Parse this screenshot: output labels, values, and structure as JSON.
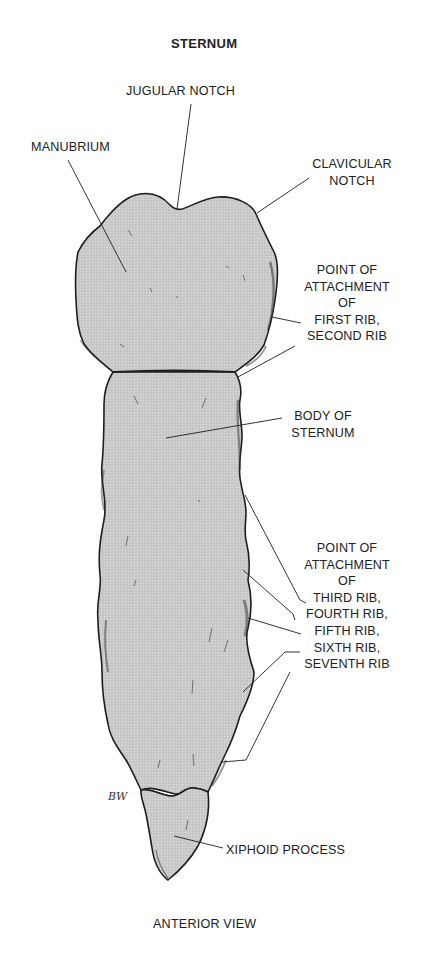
{
  "figure": {
    "title": "STERNUM",
    "caption": "ANTERIOR VIEW",
    "signature": "BW",
    "colors": {
      "background": "#ffffff",
      "bone_fill": "#cbcbcb",
      "outline": "#1e1e1e",
      "text": "#222222"
    }
  },
  "labels": {
    "jugular_notch": "JUGULAR NOTCH",
    "manubrium": "MANUBRIUM",
    "clavicular_notch": [
      "CLAVICULAR",
      "NOTCH"
    ],
    "attachment_upper": [
      "POINT OF",
      "ATTACHMENT",
      "OF",
      "FIRST RIB,",
      "SECOND RIB"
    ],
    "body_of_sternum": [
      "BODY OF",
      "STERNUM"
    ],
    "attachment_lower": [
      "POINT OF",
      "ATTACHMENT",
      "OF",
      "THIRD RIB,",
      "FOURTH RIB,",
      "FIFTH RIB,",
      "SIXTH RIB,",
      "SEVENTH RIB"
    ],
    "xiphoid_process": "XIPHOID PROCESS"
  }
}
